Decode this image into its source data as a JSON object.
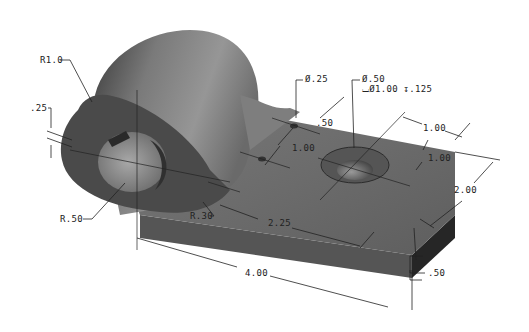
{
  "drawing": {
    "type": "isometric engineering drawing",
    "part": "bracket with cylindrical boss and rectangular plate",
    "colors": {
      "background": "#ffffff",
      "part_top": "#6e6e6e",
      "part_side": "#4a4a4a",
      "part_dark": "#262626",
      "cylinder_light": "#8c8c8c",
      "dimension": "#222222"
    },
    "dimensions": {
      "outer_radius": "R1.0",
      "slot_width": ".25",
      "bore_radius": "R.50",
      "fillet_radius": "R.30",
      "small_hole_dia": "Ø.25",
      "cbore_hole_dia": "Ø.50",
      "cbore_spec": "⌴Ø1.00 ↧.125",
      "hole_spacing_x": ".50",
      "hole_spacing_y_small": "1.00",
      "cbore_from_end": "1.00",
      "cbore_from_edge": "1.00",
      "plate_width": "2.00",
      "plate_thickness": ".50",
      "hole_from_center": "2.25",
      "overall_length": "4.00"
    }
  }
}
